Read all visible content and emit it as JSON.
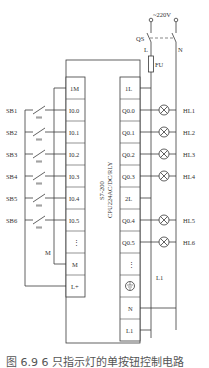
{
  "figure": {
    "power": {
      "supply_label": "~220V",
      "switch_label": "QS",
      "line_label": "L",
      "neutral_label": "N",
      "fuse_label": "FU"
    },
    "plc": {
      "model_line1": "S7-200",
      "model_line2": "CPU224AC/DC/RLY",
      "inputs": [
        "1M",
        "I0.0",
        "I0.1",
        "I0.2",
        "I0.3",
        "I0.4",
        "I0.5",
        "⋮",
        "M",
        "L+"
      ],
      "outputs": [
        "1L",
        "Q0.0",
        "Q0.1",
        "Q0.2",
        "Q0.3",
        "2L",
        "Q0.4",
        "Q0.5",
        "⋮",
        "⏚",
        "N",
        "L1"
      ]
    },
    "buttons": [
      "SB1",
      "SB2",
      "SB3",
      "SB4",
      "SB5",
      "SB6"
    ],
    "lamps": [
      "HL1",
      "HL2",
      "HL3",
      "HL4",
      "HL5",
      "HL6"
    ],
    "labels": {
      "common_m": "M",
      "l1_wire": "L1"
    },
    "caption": "图 6.9   6 只指示灯的单按钮控制电路"
  }
}
